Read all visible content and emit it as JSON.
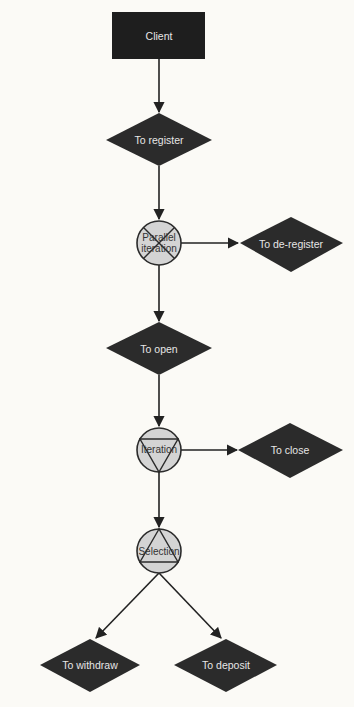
{
  "diagram": {
    "type": "flowchart",
    "colors": {
      "background": "#fbfaf6",
      "shape_fill": "#2b2b2b",
      "shape_text": "#e6e6e6",
      "control_fill": "#d4d4d4",
      "control_stroke": "#2b2b2b",
      "control_text": "#333333",
      "edge": "#222222"
    },
    "nodes": {
      "client": {
        "label": "Client",
        "shape": "rectangle"
      },
      "register": {
        "label": "To register",
        "shape": "diamond"
      },
      "parallel": {
        "label_line1": "Parallel",
        "label_line2": "iteration",
        "shape": "circle",
        "symbol": "cross"
      },
      "deregister": {
        "label": "To de-register",
        "shape": "diamond"
      },
      "open": {
        "label": "To open",
        "shape": "diamond"
      },
      "iteration": {
        "label": "Iteration",
        "shape": "circle",
        "symbol": "down-triangle"
      },
      "close": {
        "label": "To close",
        "shape": "diamond"
      },
      "selection": {
        "label": "Selection",
        "shape": "circle",
        "symbol": "up-triangle"
      },
      "withdraw": {
        "label": "To withdraw",
        "shape": "diamond"
      },
      "deposit": {
        "label": "To deposit",
        "shape": "diamond"
      }
    },
    "edges": [
      {
        "from": "Client",
        "to": "To register"
      },
      {
        "from": "To register",
        "to": "Parallel iteration"
      },
      {
        "from": "Parallel iteration",
        "to": "To de-register"
      },
      {
        "from": "Parallel iteration",
        "to": "To open"
      },
      {
        "from": "To open",
        "to": "Iteration"
      },
      {
        "from": "Iteration",
        "to": "To close"
      },
      {
        "from": "Iteration",
        "to": "Selection"
      },
      {
        "from": "Selection",
        "to": "To withdraw"
      },
      {
        "from": "Selection",
        "to": "To deposit"
      }
    ]
  }
}
